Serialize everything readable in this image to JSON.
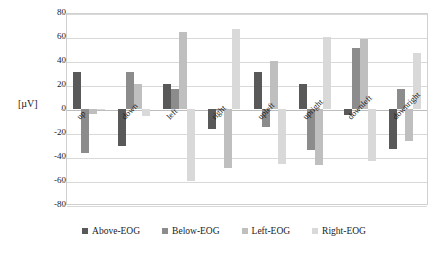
{
  "chart_data": {
    "type": "bar",
    "title": "",
    "xlabel": "",
    "ylabel": "[µV]",
    "ylim": [
      -80,
      80
    ],
    "yticks": [
      80,
      60,
      40,
      20,
      0,
      -20,
      -40,
      -60,
      -80
    ],
    "ytick_labels": [
      "80",
      "60",
      "40",
      "20",
      "0",
      "-20",
      "-40",
      "-60",
      "-80"
    ],
    "grid": "horizontal",
    "legend_position": "bottom",
    "categories": [
      "up",
      "down",
      "left",
      "right",
      "upleft",
      "upright",
      "downleft",
      "downright"
    ],
    "series": [
      {
        "name": "Above-EOG",
        "color": "#595959",
        "values": [
          31,
          -31,
          21,
          -17,
          31,
          21,
          -5,
          -33
        ]
      },
      {
        "name": "Below-EOG",
        "color": "#8c8c8c",
        "values": [
          -37,
          31,
          17,
          -1,
          -15,
          -34,
          51,
          17
        ]
      },
      {
        "name": "Left-EOG",
        "color": "#bfbfbf",
        "values": [
          -4,
          21,
          64,
          -49,
          40,
          -47,
          58,
          -27
        ]
      },
      {
        "name": "Right-EOG",
        "color": "#d9d9d9",
        "values": [
          -1,
          -6,
          -60,
          67,
          -46,
          60,
          -43,
          47
        ]
      }
    ]
  },
  "legend": {
    "items": [
      {
        "label": "Above-EOG",
        "color": "#595959"
      },
      {
        "label": "Below-EOG",
        "color": "#8c8c8c"
      },
      {
        "label": "Left-EOG",
        "color": "#bfbfbf"
      },
      {
        "label": "Right-EOG",
        "color": "#d9d9d9"
      }
    ]
  }
}
